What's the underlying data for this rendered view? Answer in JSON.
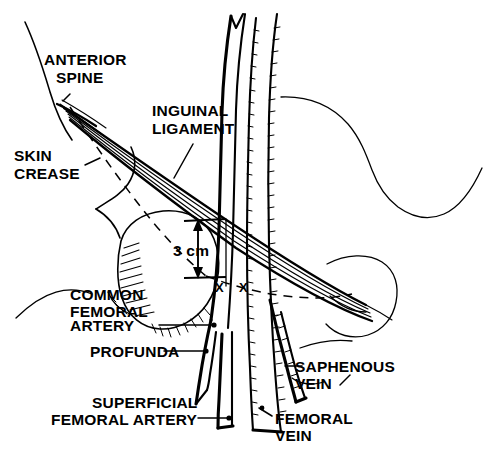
{
  "figure": {
    "type": "anatomical-line-drawing",
    "background_color": "#ffffff",
    "ink_color": "#000000",
    "width": 498,
    "height": 455
  },
  "labels": {
    "anterior_spine": "ANTERIOR\nSPINE",
    "anterior_spine_line1": "ANTERIOR",
    "anterior_spine_line2": "SPINE",
    "inguinal_ligament_line1": "INGUINAL",
    "inguinal_ligament_line2": "LIGAMENT",
    "skin_crease_line1": "SKIN",
    "skin_crease_line2": "CREASE",
    "measurement": "3 cm",
    "common_femoral_artery_line1": "COMMON",
    "common_femoral_artery_line2": "FEMORAL",
    "common_femoral_artery_line3": "ARTERY",
    "profunda": "PROFUNDA",
    "superficial_femoral_artery_line1": "SUPERFICIAL",
    "superficial_femoral_artery_line2": "FEMORAL ARTERY",
    "saphenous_vein_line1": "SAPHENOUS",
    "saphenous_vein_line2": "VEIN",
    "femoral_vein_line1": "FEMORAL",
    "femoral_vein_line2": "VEIN",
    "puncture_mark_left": "X",
    "puncture_mark_right": "X"
  },
  "structures": [
    {
      "name": "anterior-superior-iliac-spine",
      "kind": "bone-landmark"
    },
    {
      "name": "inguinal-ligament",
      "kind": "ligament-bundle"
    },
    {
      "name": "skin-crease",
      "kind": "dashed-surface-line"
    },
    {
      "name": "femoral-head",
      "kind": "bone-hatched-oval"
    },
    {
      "name": "common-femoral-artery",
      "kind": "artery"
    },
    {
      "name": "profunda-femoris-artery",
      "kind": "artery-branch"
    },
    {
      "name": "superficial-femoral-artery",
      "kind": "artery-branch"
    },
    {
      "name": "femoral-vein",
      "kind": "vein-hatched"
    },
    {
      "name": "saphenous-vein",
      "kind": "vein-hatched-branch"
    },
    {
      "name": "puncture-site-markers",
      "kind": "x-markers"
    },
    {
      "name": "dimension-3cm",
      "kind": "measurement-arrow"
    }
  ]
}
